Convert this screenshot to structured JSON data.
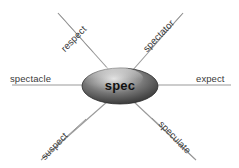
{
  "diagram": {
    "type": "word-web",
    "center": {
      "label": "spec"
    },
    "spokes": [
      {
        "label": "spectacle",
        "direction": "left"
      },
      {
        "label": "expect",
        "direction": "right"
      },
      {
        "label": "respect",
        "direction": "upper-left"
      },
      {
        "label": "spectator",
        "direction": "upper-right"
      },
      {
        "label": "suspect",
        "direction": "lower-left"
      },
      {
        "label": "speculate",
        "direction": "lower-right"
      }
    ],
    "colors": {
      "background": "#ffffff",
      "line": "#9a9a9a",
      "label_text": "#3a3a3a",
      "center_text": "#111111",
      "node_dark": "#3b3b3b",
      "node_mid": "#7d7d7d",
      "node_light": "#d8d8d8"
    }
  }
}
